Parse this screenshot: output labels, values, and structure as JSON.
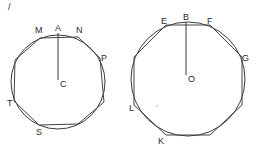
{
  "figure": {
    "corner_mark": "/",
    "left": {
      "center_label": "C",
      "radius_end_label": "A",
      "vertices": [
        "M",
        "N",
        "P",
        "S",
        "T"
      ],
      "circle": {
        "cx": 58,
        "cy": 82,
        "r": 47
      },
      "polygon_sides": 7
    },
    "right": {
      "center_label": "O",
      "radius_end_label": "B",
      "vertices": [
        "E",
        "F",
        "G",
        "K",
        "L"
      ],
      "circle": {
        "cx": 188,
        "cy": 79,
        "r": 57
      },
      "polygon_sides": 8
    }
  }
}
